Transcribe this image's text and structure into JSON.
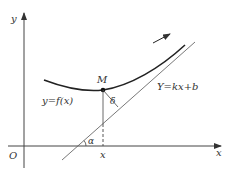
{
  "diagram": {
    "axes": {
      "x_label": "x",
      "y_label": "y",
      "origin_label": "O"
    },
    "curve": {
      "label": "y=f(x)"
    },
    "asymptote": {
      "label": "Y=kx+b"
    },
    "point": {
      "label": "M",
      "foot_label": "x"
    },
    "distance_label": "δ",
    "angle_label": "α",
    "colors": {
      "stroke": "#333333",
      "background": "#ffffff"
    }
  }
}
